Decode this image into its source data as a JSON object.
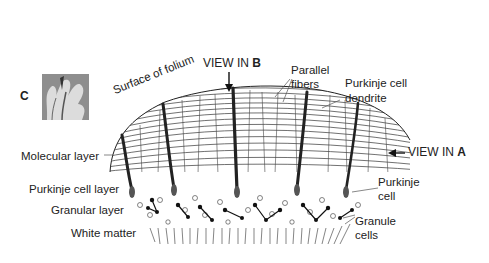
{
  "figure": {
    "panel_label": "C",
    "labels": {
      "view_b_prefix": "VIEW IN ",
      "view_b_letter": "B",
      "view_a_prefix": "VIEW IN ",
      "view_a_letter": "A",
      "surface": "Surface of folium",
      "parallel_fibers_1": "Parallel",
      "parallel_fibers_2": "fibers",
      "purkinje_dendrite_1": "Purkinje cell",
      "purkinje_dendrite_2": "dendrite",
      "molecular_layer": "Molecular layer",
      "purkinje_cell_layer": "Purkinje cell layer",
      "granular_layer": "Granular layer",
      "white_matter": "White matter",
      "purkinje_cell_1": "Purkinje",
      "purkinje_cell_2": "cell",
      "granule_cells_1": "Granule",
      "granule_cells_2": "cells"
    },
    "icons": {
      "down_arrow": "arrow-down-icon",
      "left_arrow": "arrow-left-icon"
    }
  }
}
